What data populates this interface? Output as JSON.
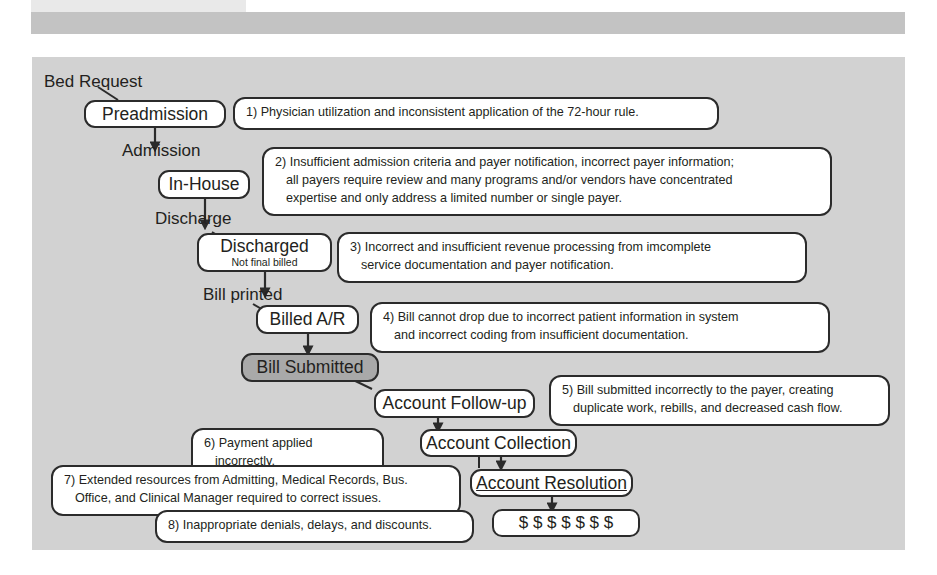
{
  "diagram": {
    "title_bar": {
      "visible": true,
      "bar_color": "#c3c3c3",
      "accent_color": "#e9e9e9"
    },
    "panel_color": "#d2d2d2",
    "shaded_box_color": "#a9a9a9",
    "stage_labels": [
      {
        "name": "bed-request",
        "text": "Bed Request"
      },
      {
        "name": "admission",
        "text": "Admission"
      },
      {
        "name": "discharge",
        "text": "Discharge"
      },
      {
        "name": "bill-printed",
        "text": "Bill printed"
      }
    ],
    "process_boxes": [
      {
        "name": "preadmission",
        "title": "Preadmission",
        "subtitle": "",
        "shaded": false,
        "underline": false
      },
      {
        "name": "in-house",
        "title": "In-House",
        "subtitle": "",
        "shaded": false,
        "underline": false
      },
      {
        "name": "discharged",
        "title": "Discharged",
        "subtitle": "Not final billed",
        "shaded": false,
        "underline": false
      },
      {
        "name": "billed-ar",
        "title": "Billed A/R",
        "subtitle": "",
        "shaded": false,
        "underline": false
      },
      {
        "name": "bill-submitted",
        "title": "Bill Submitted",
        "subtitle": "",
        "shaded": true,
        "underline": false
      },
      {
        "name": "account-follow-up",
        "title": "Account Follow-up",
        "subtitle": "",
        "shaded": false,
        "underline": false
      },
      {
        "name": "account-collection",
        "title": "Account Collection",
        "subtitle": "",
        "shaded": false,
        "underline": false
      },
      {
        "name": "account-resolution",
        "title": "Account Resolution",
        "subtitle": "",
        "shaded": false,
        "underline": true
      }
    ],
    "money_box": {
      "name": "cash-box",
      "symbols": "$ $ $ $ $ $ $",
      "count": 7
    },
    "notes": [
      {
        "number": "1)",
        "lines": [
          "1) Physician utilization and inconsistent application of the 72-hour rule."
        ]
      },
      {
        "number": "2)",
        "lines": [
          "2) Insufficient admission criteria and payer notification, incorrect payer information;",
          "all payers require review and many programs and/or vendors have concentrated",
          "expertise and only address a limited number or single payer."
        ]
      },
      {
        "number": "3)",
        "lines": [
          "3) Incorrect and insufficient revenue processing from imcomplete",
          "service documentation and payer notification."
        ]
      },
      {
        "number": "4)",
        "lines": [
          "4) Bill cannot drop due to incorrect patient information in system",
          "and incorrect coding from insufficient documentation."
        ]
      },
      {
        "number": "5)",
        "lines": [
          "5) Bill submitted incorrectly to the payer, creating",
          "duplicate work, rebills, and decreased cash flow."
        ]
      },
      {
        "number": "6)",
        "lines": [
          "6) Payment applied incorrectly."
        ]
      },
      {
        "number": "7)",
        "lines": [
          "7) Extended resources from Admitting, Medical Records, Bus.",
          "Office, and Clinical Manager required to correct issues."
        ]
      },
      {
        "number": "8)",
        "lines": [
          "8) Inappropriate denials, delays, and discounts."
        ]
      }
    ]
  }
}
